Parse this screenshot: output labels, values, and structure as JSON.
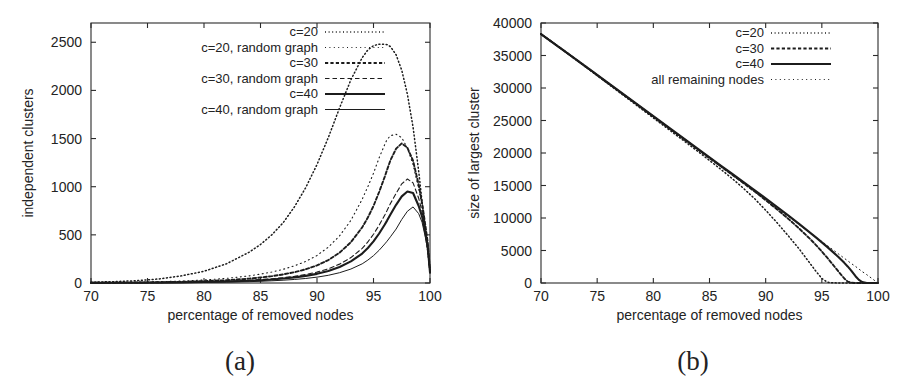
{
  "figure": {
    "background": "#ffffff",
    "ink_color": "#1c1c1c"
  },
  "panels": [
    {
      "id": "panel-a",
      "caption": "(a)",
      "chart_data": {
        "type": "line",
        "title": "",
        "xlabel": "percentage of removed nodes",
        "ylabel": "independent clusters",
        "xlim": [
          70,
          100
        ],
        "ylim": [
          0,
          2700
        ],
        "xticks": [
          70,
          75,
          80,
          85,
          90,
          95,
          100
        ],
        "yticks": [
          0,
          500,
          1000,
          1500,
          2000,
          2500
        ],
        "xtick_labels": [
          "70",
          "75",
          "80",
          "85",
          "90",
          "95",
          "100"
        ],
        "ytick_labels": [
          "0",
          "500",
          "1000",
          "1500",
          "2000",
          "2500"
        ],
        "grid": false,
        "legend_position": "top-center",
        "x": [
          70,
          72,
          74,
          76,
          78,
          80,
          82,
          84,
          85,
          86,
          87,
          88,
          89,
          90,
          91,
          92,
          93,
          94,
          94.5,
          95,
          95.5,
          96,
          96.2,
          96.5,
          97,
          97.5,
          98,
          98.5,
          99,
          99.3,
          99.6,
          99.8,
          100
        ],
        "series": [
          {
            "name": "c=20",
            "dash": "1,2.6",
            "width": 1.5,
            "values": [
              8,
              14,
              24,
              42,
              74,
              122,
              200,
              320,
              400,
              500,
              625,
              790,
              990,
              1230,
              1510,
              1820,
              2110,
              2340,
              2420,
              2465,
              2480,
              2478,
              2475,
              2455,
              2370,
              2210,
              1960,
              1620,
              1160,
              840,
              520,
              330,
              130
            ]
          },
          {
            "name": "c=20, random graph",
            "dash": "1,3.4",
            "width": 1.1,
            "values": [
              3,
              5,
              8,
              13,
              20,
              31,
              48,
              74,
              92,
              114,
              142,
              178,
              224,
              286,
              372,
              490,
              650,
              870,
              1000,
              1140,
              1300,
              1440,
              1490,
              1530,
              1545,
              1510,
              1400,
              1230,
              980,
              800,
              570,
              400,
              120
            ]
          },
          {
            "name": "c=30",
            "dash": "3.2,2.2",
            "width": 1.9,
            "values": [
              2,
              3,
              5,
              8,
              12,
              19,
              29,
              45,
              57,
              71,
              89,
              112,
              142,
              182,
              238,
              315,
              424,
              578,
              680,
              800,
              945,
              1105,
              1175,
              1275,
              1395,
              1450,
              1405,
              1270,
              1020,
              830,
              590,
              420,
              130
            ]
          },
          {
            "name": "c=30, random graph",
            "dash": "4.5,3",
            "width": 1.1,
            "values": [
              1,
              2,
              3,
              5,
              8,
              12,
              18,
              28,
              35,
              44,
              55,
              69,
              88,
              113,
              148,
              196,
              264,
              360,
              427,
              506,
              600,
              706,
              752,
              825,
              930,
              1030,
              1080,
              1040,
              880,
              740,
              540,
              390,
              115
            ]
          },
          {
            "name": "c=40",
            "dash": "none",
            "width": 2.1,
            "values": [
              1,
              2,
              3,
              4,
              6,
              10,
              15,
              23,
              29,
              36,
              46,
              58,
              74,
              95,
              125,
              166,
              224,
              306,
              364,
              432,
              514,
              608,
              648,
              712,
              812,
              900,
              950,
              935,
              800,
              690,
              510,
              370,
              110
            ]
          },
          {
            "name": "c=40, random graph",
            "dash": "none",
            "width": 1.0,
            "values": [
              1,
              1,
              2,
              3,
              4,
              6,
              9,
              14,
              18,
              23,
              29,
              37,
              47,
              61,
              80,
              107,
              145,
              199,
              238,
              284,
              340,
              406,
              434,
              480,
              560,
              660,
              745,
              790,
              720,
              630,
              470,
              340,
              100
            ]
          }
        ]
      }
    },
    {
      "id": "panel-b",
      "caption": "(b)",
      "chart_data": {
        "type": "line",
        "title": "",
        "xlabel": "percentage of removed nodes",
        "ylabel": "size of largest cluster",
        "xlim": [
          70,
          100
        ],
        "ylim": [
          0,
          40000
        ],
        "xticks": [
          70,
          75,
          80,
          85,
          90,
          95,
          100
        ],
        "yticks": [
          0,
          5000,
          10000,
          15000,
          20000,
          25000,
          30000,
          35000,
          40000
        ],
        "xtick_labels": [
          "70",
          "75",
          "80",
          "85",
          "90",
          "95",
          "100"
        ],
        "ytick_labels": [
          "0",
          "5000",
          "10000",
          "15000",
          "20000",
          "25000",
          "30000",
          "35000",
          "40000"
        ],
        "grid": false,
        "legend_position": "top-right",
        "x": [
          70,
          72,
          74,
          76,
          78,
          80,
          82,
          84,
          86,
          87,
          88,
          89,
          90,
          91,
          92,
          93,
          94,
          94.5,
          95,
          95.5,
          96,
          96.5,
          97,
          97.3,
          97.6,
          98,
          98.3,
          98.6,
          99,
          99.5,
          100
        ],
        "series": [
          {
            "name": "c=20",
            "dash": "1,2.6",
            "width": 1.5,
            "values": [
              38300,
              35800,
              33200,
              30600,
              28000,
              25400,
              22800,
              20200,
              17500,
              16100,
              14600,
              13000,
              11200,
              9300,
              7300,
              5200,
              2900,
              1750,
              700,
              120,
              30,
              10,
              5,
              0,
              0,
              0,
              0,
              0,
              0,
              0,
              0
            ]
          },
          {
            "name": "c=30",
            "dash": "3.2,2.2",
            "width": 1.9,
            "values": [
              38300,
              35800,
              33250,
              30700,
              28150,
              25600,
              23050,
              20500,
              17950,
              16680,
              15400,
              14100,
              12750,
              11350,
              9900,
              8350,
              6700,
              5800,
              4850,
              3850,
              2800,
              1720,
              700,
              220,
              40,
              0,
              0,
              0,
              0,
              0,
              0
            ]
          },
          {
            "name": "c=40",
            "dash": "none",
            "width": 2.1,
            "values": [
              38300,
              35800,
              33280,
              30750,
              28200,
              25680,
              23150,
              20600,
              18080,
              16820,
              15560,
              14300,
              13020,
              11720,
              10400,
              9050,
              7680,
              6980,
              6250,
              5520,
              4750,
              3950,
              3100,
              2550,
              1950,
              1050,
              480,
              140,
              10,
              0,
              0
            ]
          },
          {
            "name": "all remaining nodes",
            "dash": "1,3.4",
            "width": 1.0,
            "values": [
              38300,
              35770,
              33200,
              30650,
              28100,
              25550,
              23000,
              20450,
              17900,
              16620,
              15350,
              14070,
              12800,
              11500,
              10250,
              8950,
              7680,
              7000,
              6400,
              5750,
              5100,
              4450,
              3800,
              3420,
              3020,
              2550,
              2150,
              1750,
              1280,
              640,
              0
            ]
          }
        ]
      }
    }
  ]
}
